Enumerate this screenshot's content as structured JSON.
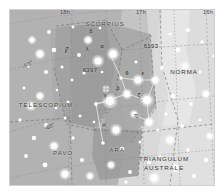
{
  "chart_data": {
    "type": "scatter",
    "xlabel": "Right Ascension",
    "ylabel": "Declination",
    "grid": true,
    "legend_position": "none",
    "projection": "conic",
    "ra_ticks": [
      "18h",
      "17h",
      "16h"
    ],
    "dec_ticks": [
      "-50°",
      "-60°"
    ],
    "xlim": [
      "18h",
      "16h"
    ],
    "ylim": [
      -70,
      -42
    ],
    "constellations": [
      {
        "name": "SCORPIUS",
        "x": 104,
        "y": 23,
        "rot": 0,
        "lines": [
          "SCORPIUS"
        ]
      },
      {
        "name": "NORMA",
        "x": 183,
        "y": 71,
        "rot": 0,
        "lines": [
          "NORMA"
        ]
      },
      {
        "name": "TELESCOPIUM",
        "x": 45,
        "y": 104,
        "rot": 0,
        "lines": [
          "TELESCOPIUM"
        ]
      },
      {
        "name": "PAVO",
        "x": 62,
        "y": 152,
        "rot": 0,
        "lines": [
          "PAVO"
        ]
      },
      {
        "name": "ARA",
        "x": 116,
        "y": 149,
        "rot": 0,
        "lines": [
          "ARA"
        ]
      },
      {
        "name": "TRIANGULUM AUSTRALE",
        "x": 163,
        "y": 163,
        "rot": 0,
        "lines": [
          "TRIANGULUM",
          "AUSTRALE"
        ]
      }
    ],
    "deep_sky_objects": [
      {
        "label": "6193",
        "x": 150,
        "y": 45,
        "symbol": "open-cluster",
        "sx": 163,
        "sy": 45
      },
      {
        "label": "6397",
        "x": 89,
        "y": 69,
        "symbol": "globular-cluster",
        "sx": 96,
        "sy": 79
      }
    ],
    "star_labels": [
      {
        "greek": "δ",
        "x": 90,
        "y": 31
      },
      {
        "greek": "σ",
        "x": 66,
        "y": 48
      },
      {
        "greek": "λ",
        "x": 86,
        "y": 49
      },
      {
        "greek": "α",
        "x": 101,
        "y": 46
      },
      {
        "greek": "ε",
        "x": 65,
        "y": 51
      },
      {
        "greek": "θ",
        "x": 126,
        "y": 73
      },
      {
        "greek": "ε",
        "x": 142,
        "y": 73
      },
      {
        "greek": "β",
        "x": 117,
        "y": 88
      },
      {
        "greek": "γ",
        "x": 104,
        "y": 95
      },
      {
        "greek": "ζ",
        "x": 138,
        "y": 95
      },
      {
        "greek": "η",
        "x": 135,
        "y": 115
      },
      {
        "greek": "μ",
        "x": 103,
        "y": 124
      }
    ],
    "ra_label_positions": [
      {
        "label": "18h",
        "x": 64,
        "y": 12
      },
      {
        "label": "17h",
        "x": 140,
        "y": 12
      },
      {
        "label": "16h",
        "x": 207,
        "y": 12
      }
    ],
    "dec_label_positions": [
      {
        "label": "-50°",
        "x": 27,
        "y": 64,
        "rot": -28
      },
      {
        "label": "-60°",
        "x": 49,
        "y": 126,
        "rot": -24
      }
    ],
    "stars": [
      {
        "x": 22,
        "y": 30,
        "m": 2.4
      },
      {
        "x": 39,
        "y": 22,
        "m": 1.8
      },
      {
        "x": 30,
        "y": 44,
        "m": 3.0
      },
      {
        "x": 44,
        "y": 40,
        "m": 2.2
      },
      {
        "x": 18,
        "y": 56,
        "m": 1.6
      },
      {
        "x": 36,
        "y": 62,
        "m": 2.0
      },
      {
        "x": 52,
        "y": 57,
        "m": 1.5
      },
      {
        "x": 14,
        "y": 78,
        "m": 1.4
      },
      {
        "x": 30,
        "y": 86,
        "m": 2.6
      },
      {
        "x": 47,
        "y": 80,
        "m": 1.3
      },
      {
        "x": 21,
        "y": 96,
        "m": 2.8
      },
      {
        "x": 10,
        "y": 110,
        "m": 1.7
      },
      {
        "x": 36,
        "y": 115,
        "m": 1.9
      },
      {
        "x": 55,
        "y": 108,
        "m": 1.5
      },
      {
        "x": 24,
        "y": 128,
        "m": 2.1
      },
      {
        "x": 44,
        "y": 136,
        "m": 2.9
      },
      {
        "x": 63,
        "y": 128,
        "m": 1.6
      },
      {
        "x": 16,
        "y": 146,
        "m": 1.8
      },
      {
        "x": 35,
        "y": 155,
        "m": 2.3
      },
      {
        "x": 55,
        "y": 164,
        "m": 3.2
      },
      {
        "x": 72,
        "y": 150,
        "m": 2.0
      },
      {
        "x": 80,
        "y": 166,
        "m": 2.5
      },
      {
        "x": 63,
        "y": 17,
        "m": 1.4
      },
      {
        "x": 78,
        "y": 30,
        "m": 2.7
      },
      {
        "x": 90,
        "y": 18,
        "m": 1.3
      },
      {
        "x": 69,
        "y": 45,
        "m": 1.9
      },
      {
        "x": 88,
        "y": 51,
        "m": 3.4
      },
      {
        "x": 103,
        "y": 44,
        "m": 3.6
      },
      {
        "x": 74,
        "y": 63,
        "m": 1.5
      },
      {
        "x": 96,
        "y": 79,
        "m": 2.0
      },
      {
        "x": 111,
        "y": 68,
        "m": 1.6
      },
      {
        "x": 86,
        "y": 94,
        "m": 1.8
      },
      {
        "x": 100,
        "y": 91,
        "m": 4.2
      },
      {
        "x": 117,
        "y": 84,
        "m": 3.0
      },
      {
        "x": 128,
        "y": 70,
        "m": 3.2
      },
      {
        "x": 145,
        "y": 70,
        "m": 2.8
      },
      {
        "x": 137,
        "y": 90,
        "m": 3.8
      },
      {
        "x": 124,
        "y": 104,
        "m": 2.4
      },
      {
        "x": 139,
        "y": 112,
        "m": 3.0
      },
      {
        "x": 106,
        "y": 120,
        "m": 3.4
      },
      {
        "x": 93,
        "y": 133,
        "m": 1.7
      },
      {
        "x": 112,
        "y": 139,
        "m": 2.2
      },
      {
        "x": 130,
        "y": 132,
        "m": 1.5
      },
      {
        "x": 101,
        "y": 155,
        "m": 2.6
      },
      {
        "x": 120,
        "y": 162,
        "m": 1.9
      },
      {
        "x": 139,
        "y": 152,
        "m": 2.1
      },
      {
        "x": 152,
        "y": 58,
        "m": 1.8
      },
      {
        "x": 168,
        "y": 40,
        "m": 2.3
      },
      {
        "x": 160,
        "y": 24,
        "m": 1.5
      },
      {
        "x": 178,
        "y": 20,
        "m": 2.0
      },
      {
        "x": 192,
        "y": 32,
        "m": 1.6
      },
      {
        "x": 175,
        "y": 56,
        "m": 2.5
      },
      {
        "x": 190,
        "y": 62,
        "m": 1.4
      },
      {
        "x": 163,
        "y": 86,
        "m": 2.2
      },
      {
        "x": 181,
        "y": 94,
        "m": 1.8
      },
      {
        "x": 196,
        "y": 84,
        "m": 2.7
      },
      {
        "x": 156,
        "y": 104,
        "m": 1.6
      },
      {
        "x": 172,
        "y": 116,
        "m": 2.0
      },
      {
        "x": 190,
        "y": 110,
        "m": 1.5
      },
      {
        "x": 200,
        "y": 126,
        "m": 2.4
      },
      {
        "x": 160,
        "y": 130,
        "m": 3.0
      },
      {
        "x": 178,
        "y": 140,
        "m": 1.7
      },
      {
        "x": 196,
        "y": 150,
        "m": 2.2
      },
      {
        "x": 150,
        "y": 146,
        "m": 1.5
      },
      {
        "x": 165,
        "y": 158,
        "m": 2.8
      },
      {
        "x": 184,
        "y": 166,
        "m": 2.0
      },
      {
        "x": 144,
        "y": 168,
        "m": 3.3
      },
      {
        "x": 116,
        "y": 172,
        "m": 1.6
      },
      {
        "x": 62,
        "y": 70,
        "m": 1.4
      },
      {
        "x": 58,
        "y": 92,
        "m": 1.5
      },
      {
        "x": 84,
        "y": 112,
        "m": 1.3
      },
      {
        "x": 126,
        "y": 52,
        "m": 1.4
      },
      {
        "x": 148,
        "y": 120,
        "m": 1.4
      },
      {
        "x": 204,
        "y": 46,
        "m": 1.5
      },
      {
        "x": 206,
        "y": 98,
        "m": 1.3
      },
      {
        "x": 92,
        "y": 62,
        "m": 1.3
      },
      {
        "x": 70,
        "y": 106,
        "m": 1.4
      },
      {
        "x": 46,
        "y": 98,
        "m": 1.3
      }
    ],
    "constellation_lines": [
      [
        101,
        46,
        111,
        68
      ],
      [
        111,
        68,
        117,
        84
      ],
      [
        117,
        84,
        137,
        90
      ],
      [
        137,
        90,
        145,
        70
      ],
      [
        145,
        70,
        128,
        70
      ],
      [
        128,
        70,
        111,
        68
      ],
      [
        117,
        84,
        86,
        94
      ],
      [
        86,
        94,
        100,
        91
      ],
      [
        137,
        90,
        139,
        112
      ],
      [
        139,
        112,
        124,
        104
      ],
      [
        86,
        94,
        93,
        133
      ]
    ],
    "colors": {
      "sky_dark": "#9a9a9a",
      "sky_mid": "#b0b0b0",
      "sky_light": "#d4d4d4",
      "sky_lightest": "#e2e2e2",
      "star": "#ffffff",
      "grid": "#8f8f8f",
      "boundary": "#7e7e7e",
      "label": "#2b2b2b",
      "frame": "#cfcfcf"
    }
  }
}
